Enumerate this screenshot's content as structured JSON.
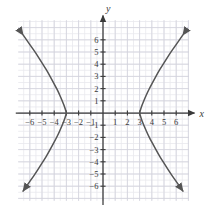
{
  "figure": {
    "title": "",
    "background_color": "#ffffff"
  },
  "chart_data": {
    "type": "line",
    "title": "",
    "xlabel": "x",
    "ylabel": "y",
    "xlim": [
      -7,
      7
    ],
    "ylim": [
      -7,
      7
    ],
    "grid": true,
    "grid_minor_step": 0.5,
    "grid_major_step": 1,
    "legend": "none",
    "x_ticks": [
      -6,
      -5,
      -4,
      -3,
      -2,
      -1,
      1,
      2,
      3,
      4,
      5,
      6
    ],
    "y_ticks": [
      -6,
      -5,
      -4,
      -3,
      -2,
      -1,
      1,
      2,
      3,
      4,
      5,
      6
    ],
    "x_tick_labels": [
      "−6",
      "−5",
      "−4",
      "−3",
      "−2",
      "−1",
      "1",
      "2",
      "3",
      "4",
      "5",
      "6"
    ],
    "y_tick_labels": [
      "−6",
      "−5",
      "−4",
      "−3",
      "−2",
      "−1",
      "1",
      "2",
      "3",
      "4",
      "5",
      "6"
    ],
    "curve_description": "hyperbola opening left and right with vertices at (-3,0) and (3,0)",
    "series": [
      {
        "name": "left-branch",
        "arrow_start": true,
        "arrow_end": true,
        "points": [
          [
            -6.55,
            6.4
          ],
          [
            -6.2,
            5.9
          ],
          [
            -5.85,
            5.4
          ],
          [
            -5.5,
            4.9
          ],
          [
            -5.15,
            4.35
          ],
          [
            -4.8,
            3.8
          ],
          [
            -4.5,
            3.3
          ],
          [
            -4.2,
            2.75
          ],
          [
            -3.9,
            2.2
          ],
          [
            -3.65,
            1.7
          ],
          [
            -3.45,
            1.25
          ],
          [
            -3.28,
            0.85
          ],
          [
            -3.15,
            0.5
          ],
          [
            -3.05,
            0.2
          ],
          [
            -3.0,
            0.0
          ],
          [
            -3.05,
            -0.2
          ],
          [
            -3.15,
            -0.5
          ],
          [
            -3.28,
            -0.85
          ],
          [
            -3.45,
            -1.25
          ],
          [
            -3.65,
            -1.7
          ],
          [
            -3.9,
            -2.2
          ],
          [
            -4.2,
            -2.75
          ],
          [
            -4.5,
            -3.3
          ],
          [
            -4.8,
            -3.8
          ],
          [
            -5.15,
            -4.35
          ],
          [
            -5.5,
            -4.9
          ],
          [
            -5.85,
            -5.4
          ],
          [
            -6.2,
            -5.9
          ],
          [
            -6.55,
            -6.4
          ]
        ]
      },
      {
        "name": "right-branch",
        "arrow_start": true,
        "arrow_end": true,
        "points": [
          [
            6.55,
            6.4
          ],
          [
            6.2,
            5.9
          ],
          [
            5.85,
            5.4
          ],
          [
            5.5,
            4.9
          ],
          [
            5.15,
            4.35
          ],
          [
            4.8,
            3.8
          ],
          [
            4.5,
            3.3
          ],
          [
            4.2,
            2.75
          ],
          [
            3.9,
            2.2
          ],
          [
            3.65,
            1.7
          ],
          [
            3.45,
            1.25
          ],
          [
            3.28,
            0.85
          ],
          [
            3.15,
            0.5
          ],
          [
            3.05,
            0.2
          ],
          [
            3.0,
            0.0
          ],
          [
            3.05,
            -0.2
          ],
          [
            3.15,
            -0.5
          ],
          [
            3.28,
            -0.85
          ],
          [
            3.45,
            -1.25
          ],
          [
            3.65,
            -1.7
          ],
          [
            3.9,
            -2.2
          ],
          [
            4.2,
            -2.75
          ],
          [
            4.5,
            -3.3
          ],
          [
            4.8,
            -3.8
          ],
          [
            5.15,
            -4.35
          ],
          [
            5.5,
            -4.9
          ],
          [
            5.85,
            -5.4
          ],
          [
            6.2,
            -5.9
          ],
          [
            6.55,
            -6.4
          ]
        ]
      }
    ],
    "colors": {
      "curve": "#555555",
      "axis": "#3a3a3a",
      "grid_minor": "#e8e8ee",
      "grid_major": "#d2d2dc",
      "background": "#ffffff"
    }
  }
}
